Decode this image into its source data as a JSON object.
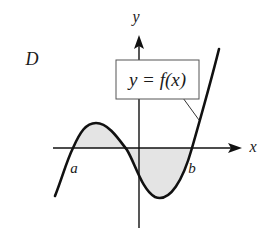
{
  "figure": {
    "panel_label": "D",
    "x_axis_label": "x",
    "y_axis_label": "y",
    "function_label": "y = f(x)",
    "point_a_label": "a",
    "point_b_label": "b",
    "shaded_region": "area between curve y = f(x) and x-axis from a to b",
    "colors": {
      "curve": "#111111",
      "axes": "#111111",
      "shade": "#e4e4e4",
      "label_box_border": "#555555"
    }
  }
}
